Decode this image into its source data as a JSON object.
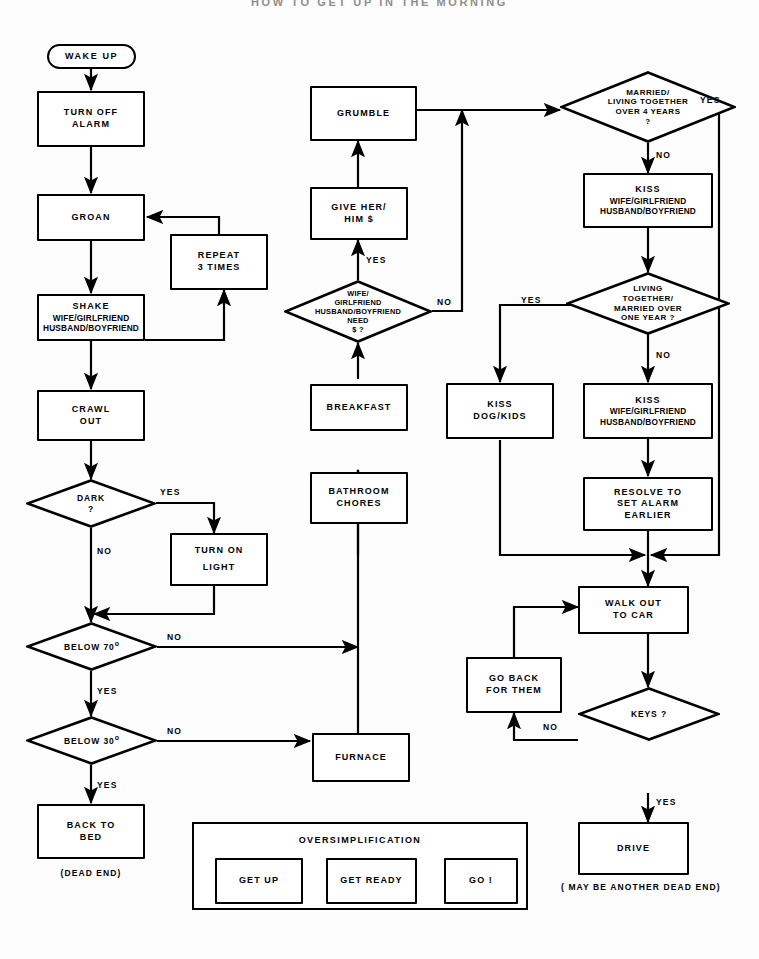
{
  "title": "HOW TO GET UP IN THE MORNING",
  "colors": {
    "ink": "#000000",
    "paper": "#ffffff"
  },
  "inset": {
    "title": "OVERSIMPLIFICATION",
    "steps": [
      {
        "label": "GET UP"
      },
      {
        "label": "GET READY"
      },
      {
        "label": "GO !"
      }
    ]
  },
  "nodes": {
    "wake_up": {
      "label": "WAKE UP",
      "shape": "terminal"
    },
    "turn_off_alarm": {
      "l1": "TURN OFF",
      "l2": "ALARM",
      "shape": "box"
    },
    "groan": {
      "l1": "GROAN",
      "shape": "box"
    },
    "repeat_3_times": {
      "l1": "REPEAT",
      "l2": "3 TIMES",
      "shape": "box"
    },
    "shake_partner": {
      "l1": "SHAKE",
      "l2": "WIFE/GIRLFRIEND",
      "l3": "HUSBAND/BOYFRIEND",
      "shape": "box"
    },
    "crawl_out": {
      "l1": "CRAWL",
      "l2": "OUT",
      "shape": "box"
    },
    "dark": {
      "l1": "DARK",
      "l2": "?",
      "shape": "diamond"
    },
    "turn_on_light": {
      "l1": "TURN ON",
      "l2": "LIGHT",
      "shape": "box"
    },
    "below_70": {
      "l1": "BELOW 70",
      "sup": "o",
      "shape": "diamond"
    },
    "below_30": {
      "l1": "BELOW 30",
      "sup": "o",
      "shape": "diamond"
    },
    "back_to_bed": {
      "l1": "BACK TO",
      "l2": "BED",
      "shape": "box",
      "note": "(DEAD END)"
    },
    "furnace": {
      "l1": "FURNACE",
      "shape": "box"
    },
    "bathroom_chores": {
      "l1": "BATHROOM",
      "l2": "CHORES",
      "shape": "box"
    },
    "breakfast": {
      "l1": "BREAKFAST",
      "shape": "box"
    },
    "need_money": {
      "l1": "WIFE/",
      "l2": "GIRLFRIEND",
      "l3": "HUSBAND/BOYFRIEND",
      "l4": "NEED",
      "l5": "$ ?",
      "shape": "diamond"
    },
    "give_money": {
      "l1": "GIVE HER/",
      "l2": "HIM $",
      "shape": "box"
    },
    "grumble": {
      "l1": "GRUMBLE",
      "shape": "box"
    },
    "married_over_4": {
      "l1": "MARRIED/",
      "l2": "LIVING TOGETHER",
      "l3": "OVER 4 YEARS",
      "l4": "?",
      "shape": "diamond"
    },
    "kiss_partner_1": {
      "l1": "KISS",
      "l2": "WIFE/GIRLFRIEND",
      "l3": "HUSBAND/BOYFRIEND",
      "shape": "box"
    },
    "living_over_1": {
      "l1": "LIVING",
      "l2": "TOGETHER/",
      "l3": "MARRIED OVER",
      "l4": "ONE YEAR ?",
      "shape": "diamond"
    },
    "kiss_dog_kids": {
      "l1": "KISS",
      "l2": "DOG/KIDS",
      "shape": "box"
    },
    "kiss_partner_2": {
      "l1": "KISS",
      "l2": "WIFE/GIRLFRIEND",
      "l3": "HUSBAND/BOYFRIEND",
      "shape": "box"
    },
    "resolve_alarm": {
      "l1": "RESOLVE TO",
      "l2": "SET ALARM",
      "l3": "EARLIER",
      "shape": "box"
    },
    "walk_out_to_car": {
      "l1": "WALK OUT",
      "l2": "TO CAR",
      "shape": "box"
    },
    "go_back_for_them": {
      "l1": "GO BACK",
      "l2": "FOR THEM",
      "shape": "box"
    },
    "keys": {
      "l1": "KEYS ?",
      "shape": "diamond"
    },
    "drive": {
      "l1": "DRIVE",
      "shape": "box",
      "note1": "( MAY BE ANOTHER",
      "note2": "DEAD END)"
    }
  },
  "edge_labels": {
    "dark_yes": "YES",
    "dark_no": "NO",
    "below70_no": "NO",
    "below70_yes": "YES",
    "below30_no": "NO",
    "below30_yes": "YES",
    "need_money_yes": "YES",
    "need_money_no": "NO",
    "married4_yes": "YES",
    "married4_no": "NO",
    "living1_yes": "YES",
    "living1_no": "NO",
    "keys_no": "NO",
    "keys_yes": "YES"
  }
}
